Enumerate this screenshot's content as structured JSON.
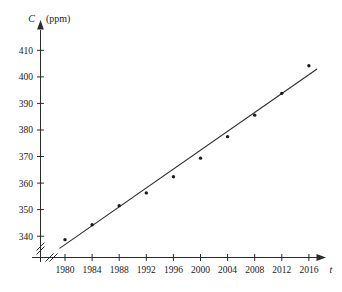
{
  "chart_data": {
    "type": "scatter",
    "title": "",
    "subtitle": "",
    "xlabel": "t",
    "ylabel": "C",
    "ylabel_units": "(ppm)",
    "x": [
      1980,
      1984,
      1988,
      1992,
      1996,
      2000,
      2004,
      2008,
      2012,
      2016
    ],
    "values": [
      338.7,
      344.3,
      351.5,
      356.3,
      362.4,
      369.4,
      377.5,
      385.6,
      393.8,
      404.2
    ],
    "series": [
      {
        "name": "CO2 concentration",
        "values": [
          338.7,
          344.3,
          351.5,
          356.3,
          362.4,
          369.4,
          377.5,
          385.6,
          393.8,
          404.2
        ]
      },
      {
        "name": "fitted line",
        "type": "line",
        "x": [
          1979.2,
          2017.2
        ],
        "values": [
          335.4,
          403.0
        ]
      }
    ],
    "x_ticks": [
      "1980",
      "1984",
      "1988",
      "1992",
      "1996",
      "2000",
      "2004",
      "2008",
      "2012",
      "2016"
    ],
    "y_ticks": [
      "340",
      "350",
      "360",
      "370",
      "380",
      "390",
      "400",
      "410"
    ],
    "xlim": [
      1978.0,
      2018.4
    ],
    "ylim": [
      333.0,
      414.0
    ],
    "grid": false,
    "legend": "none",
    "axis_break_x": true,
    "axis_break_y": true,
    "colors": {
      "axis": "#2b2b2b",
      "point": "#1a1a1a",
      "line": "#2b2b2b",
      "background": "#ffffff"
    }
  }
}
